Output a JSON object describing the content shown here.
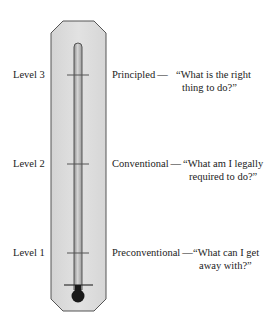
{
  "diagram": {
    "type": "thermometer-scale",
    "colors": {
      "body_fill": "#dcdcdc",
      "body_stroke": "#555555",
      "tube_fill": "#b9b9b9",
      "tube_stroke": "#555555",
      "bulb": "#1a1a1a",
      "tick": "#555555",
      "text": "#222222"
    },
    "levels": [
      {
        "label": "Level 3",
        "stage": "Principled",
        "dash": "—",
        "quote_line1": "“What is the right",
        "quote_line2": "thing to do?”"
      },
      {
        "label": "Level 2",
        "stage": "Conventional",
        "dash": "—",
        "quote_line1": "“What am I legally",
        "quote_line2": "required to do?”"
      },
      {
        "label": "Level 1",
        "stage": "Preconventional",
        "dash": "—",
        "quote_line1": "“What can I get",
        "quote_line2": "away with?”"
      }
    ]
  }
}
